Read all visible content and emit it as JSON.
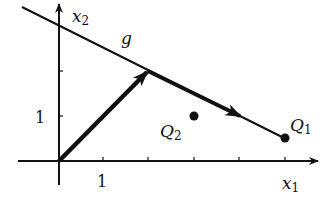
{
  "diagram": {
    "type": "coordinate-plane",
    "axes": {
      "x_label": "x",
      "x_sub": "1",
      "y_label": "x",
      "y_sub": "2",
      "x_tick_label": "1",
      "y_tick_label": "1",
      "x_ticks": [
        1,
        2,
        3,
        4,
        5
      ],
      "y_ticks": [
        1,
        2
      ]
    },
    "line": {
      "label": "g",
      "through": [
        [
          0,
          3
        ],
        [
          5,
          0.5
        ]
      ]
    },
    "vectors": [
      {
        "from": [
          0,
          0
        ],
        "to": [
          2,
          2
        ],
        "style": "bold"
      },
      {
        "from": [
          2,
          2
        ],
        "to": [
          4,
          1
        ],
        "style": "bold"
      }
    ],
    "points": [
      {
        "name": "Q",
        "sub": "1",
        "at": [
          5,
          0.5
        ]
      },
      {
        "name": "Q",
        "sub": "2",
        "at": [
          3,
          1
        ]
      }
    ],
    "colors": {
      "ink": "#111111",
      "background": "#ffffff"
    }
  }
}
